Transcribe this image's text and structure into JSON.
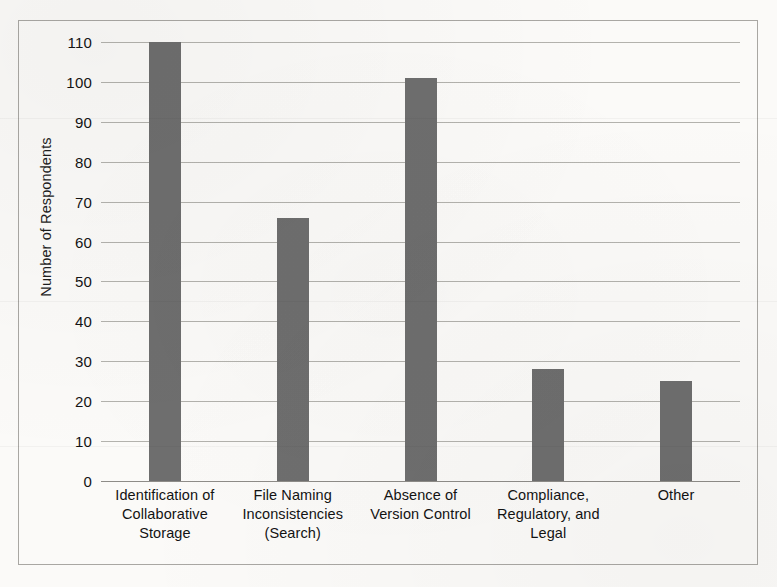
{
  "chart_data": {
    "type": "bar",
    "title": "",
    "xlabel": "",
    "ylabel": "Number of Respondents",
    "categories": [
      "Identification of\nCollaborative\nStorage",
      "File Naming\nInconsistencies\n(Search)",
      "Absence of\nVersion Control",
      "Compliance,\nRegulatory, and\nLegal",
      "Other"
    ],
    "values": [
      110,
      66,
      101,
      28,
      25
    ],
    "ylim": [
      0,
      110
    ],
    "ytick_step": 10,
    "ytick_labels": [
      "110",
      "100",
      "90",
      "80",
      "70",
      "60",
      "50",
      "40",
      "30",
      "20",
      "10",
      "0"
    ],
    "ytick_values": [
      110,
      100,
      90,
      80,
      70,
      60,
      50,
      40,
      30,
      20,
      10,
      0
    ],
    "grid": true,
    "legend": false,
    "bar_color": "#6e6e6e",
    "gridline_color": "#a6a4a0",
    "frame_color": "#a9a7a3",
    "background_color": "#fbfaf8"
  },
  "axis": {
    "y_title": "Number of Respondents"
  },
  "categories_display": [
    {
      "line1": "Identification of",
      "line2": "Collaborative",
      "line3": "Storage"
    },
    {
      "line1": "File Naming",
      "line2": "Inconsistencies",
      "line3": "(Search)"
    },
    {
      "line1": "Absence of",
      "line2": "Version Control",
      "line3": ""
    },
    {
      "line1": "Compliance,",
      "line2": "Regulatory, and",
      "line3": "Legal"
    },
    {
      "line1": "Other",
      "line2": "",
      "line3": ""
    }
  ]
}
